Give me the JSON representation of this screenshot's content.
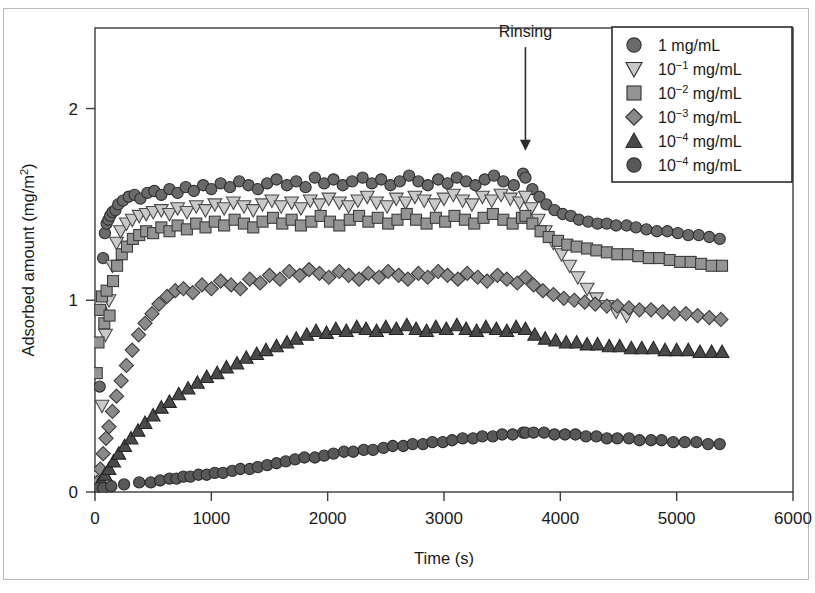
{
  "figure": {
    "background": "#ffffff",
    "frame_color": "#3b3b3b",
    "outer_border_color": "#b9b9b9"
  },
  "annotation": {
    "rinsing_label": "Rinsing",
    "rinsing_x": 3700,
    "arrow_top_y": 2.32,
    "arrow_bottom_y": 1.78
  },
  "legend": {
    "border_color": "#2b2b2b",
    "items": [
      {
        "marker": "circle",
        "label": "1 mg/mL",
        "base": "1",
        "exp": "",
        "unit": " mg/mL",
        "color": "#6a6a6a"
      },
      {
        "marker": "triangle-down",
        "label": "10-1 mg/mL",
        "base": "10",
        "exp": "−1",
        "unit": " mg/mL",
        "color": "#c9c9c9"
      },
      {
        "marker": "square",
        "label": "10-2 mg/mL",
        "base": "10",
        "exp": "−2",
        "unit": " mg/mL",
        "color": "#949494"
      },
      {
        "marker": "diamond",
        "label": "10-3 mg/mL",
        "base": "10",
        "exp": "−3",
        "unit": " mg/mL",
        "color": "#8a8a8a"
      },
      {
        "marker": "triangle-up",
        "label": "10-4 mg/mL",
        "base": "10",
        "exp": "−4",
        "unit": " mg/mL",
        "color": "#4a4a4a"
      },
      {
        "marker": "circle",
        "label": "10-4 mg/mL",
        "base": "10",
        "exp": "−4",
        "unit": " mg/mL",
        "color": "#585858"
      }
    ]
  },
  "chart_data": {
    "type": "scatter",
    "title": "",
    "xlabel": "Time (s)",
    "ylabel": "Adsorbed amount (mg/m2)",
    "ylabel_base": "Adsorbed amount (mg/m",
    "ylabel_sup": "2",
    "ylabel_tail": ")",
    "xlim": [
      0,
      6000
    ],
    "ylim": [
      0,
      2.42
    ],
    "xticks": [
      0,
      1000,
      2000,
      3000,
      4000,
      5000,
      6000
    ],
    "xticklabels": [
      "0",
      "1000",
      "2000",
      "3000",
      "4000",
      "5000",
      "6000"
    ],
    "yticks": [
      0,
      1,
      2
    ],
    "yticklabels": [
      "0",
      "1",
      "2"
    ],
    "grid": false,
    "legend_position": "upper-right",
    "rinsing_time": 3700,
    "series": [
      {
        "name": "1 mg/mL",
        "marker": "circle",
        "color": "#6a6a6a",
        "edge": "#2f2f2f",
        "size": 11,
        "x": [
          20,
          40,
          55,
          70,
          85,
          100,
          115,
          130,
          150,
          175,
          200,
          240,
          290,
          340,
          390,
          450,
          510,
          570,
          640,
          710,
          780,
          850,
          930,
          1000,
          1080,
          1160,
          1240,
          1320,
          1400,
          1480,
          1560,
          1650,
          1730,
          1810,
          1890,
          1970,
          2050,
          2130,
          2210,
          2300,
          2380,
          2460,
          2540,
          2620,
          2700,
          2780,
          2860,
          2950,
          3030,
          3110,
          3190,
          3270,
          3350,
          3430,
          3510,
          3600,
          3680,
          3700,
          3760,
          3820,
          3880,
          3950,
          4020,
          4090,
          4160,
          4240,
          4320,
          4400,
          4480,
          4570,
          4650,
          4740,
          4830,
          4920,
          5010,
          5100,
          5190,
          5280,
          5370
        ],
        "y": [
          0.1,
          0.55,
          0.95,
          1.22,
          1.35,
          1.4,
          1.42,
          1.44,
          1.46,
          1.47,
          1.5,
          1.52,
          1.54,
          1.55,
          1.53,
          1.56,
          1.57,
          1.55,
          1.58,
          1.56,
          1.59,
          1.57,
          1.6,
          1.58,
          1.61,
          1.59,
          1.62,
          1.6,
          1.58,
          1.61,
          1.63,
          1.6,
          1.62,
          1.59,
          1.64,
          1.61,
          1.63,
          1.6,
          1.62,
          1.64,
          1.61,
          1.63,
          1.6,
          1.62,
          1.65,
          1.62,
          1.6,
          1.63,
          1.61,
          1.64,
          1.62,
          1.6,
          1.63,
          1.65,
          1.62,
          1.6,
          1.66,
          1.64,
          1.58,
          1.54,
          1.5,
          1.47,
          1.45,
          1.44,
          1.42,
          1.41,
          1.4,
          1.4,
          1.39,
          1.39,
          1.38,
          1.37,
          1.36,
          1.36,
          1.35,
          1.34,
          1.34,
          1.33,
          1.32
        ]
      },
      {
        "name": "10-1 mg/mL",
        "marker": "triangle-down",
        "color": "#c9c9c9",
        "edge": "#4a4a4a",
        "size": 12,
        "x": [
          30,
          60,
          90,
          120,
          150,
          185,
          220,
          270,
          320,
          380,
          440,
          500,
          570,
          640,
          710,
          790,
          870,
          950,
          1030,
          1110,
          1190,
          1280,
          1360,
          1440,
          1520,
          1600,
          1690,
          1770,
          1850,
          1930,
          2010,
          2100,
          2180,
          2260,
          2340,
          2420,
          2510,
          2590,
          2670,
          2750,
          2830,
          2920,
          3000,
          3080,
          3160,
          3240,
          3330,
          3410,
          3490,
          3570,
          3650,
          3700,
          3750,
          3810,
          3870,
          3940,
          4010,
          4080,
          4150,
          4230,
          4310,
          4400,
          4480,
          4570
        ],
        "y": [
          0.08,
          0.45,
          0.82,
          1.0,
          1.18,
          1.3,
          1.36,
          1.4,
          1.42,
          1.44,
          1.45,
          1.46,
          1.47,
          1.45,
          1.48,
          1.46,
          1.49,
          1.47,
          1.5,
          1.48,
          1.51,
          1.49,
          1.47,
          1.5,
          1.52,
          1.49,
          1.51,
          1.48,
          1.52,
          1.5,
          1.53,
          1.51,
          1.49,
          1.52,
          1.54,
          1.51,
          1.49,
          1.53,
          1.51,
          1.54,
          1.52,
          1.5,
          1.53,
          1.55,
          1.52,
          1.5,
          1.54,
          1.52,
          1.55,
          1.53,
          1.51,
          1.54,
          1.48,
          1.42,
          1.36,
          1.3,
          1.24,
          1.18,
          1.12,
          1.06,
          1.01,
          0.97,
          0.94,
          0.92
        ]
      },
      {
        "name": "10-2 mg/mL",
        "marker": "square",
        "color": "#949494",
        "edge": "#3c3c3c",
        "size": 11,
        "x": [
          15,
          30,
          45,
          60,
          80,
          100,
          125,
          155,
          190,
          230,
          275,
          325,
          380,
          440,
          500,
          570,
          640,
          710,
          790,
          870,
          950,
          1030,
          1110,
          1200,
          1280,
          1360,
          1440,
          1530,
          1610,
          1690,
          1770,
          1860,
          1940,
          2020,
          2100,
          2190,
          2270,
          2350,
          2430,
          2520,
          2600,
          2680,
          2760,
          2850,
          2930,
          3010,
          3090,
          3180,
          3260,
          3340,
          3420,
          3510,
          3590,
          3670,
          3700,
          3760,
          3830,
          3900,
          3980,
          4060,
          4140,
          4230,
          4310,
          4400,
          4490,
          4580,
          4670,
          4760,
          4850,
          4940,
          5030,
          5120,
          5210,
          5300,
          5390
        ],
        "y": [
          0.62,
          0.78,
          0.95,
          1.02,
          0.88,
          1.05,
          0.92,
          1.1,
          1.18,
          1.24,
          1.28,
          1.32,
          1.34,
          1.36,
          1.35,
          1.38,
          1.36,
          1.39,
          1.37,
          1.4,
          1.38,
          1.41,
          1.39,
          1.42,
          1.4,
          1.38,
          1.41,
          1.43,
          1.4,
          1.42,
          1.39,
          1.41,
          1.44,
          1.41,
          1.39,
          1.42,
          1.44,
          1.41,
          1.43,
          1.4,
          1.42,
          1.45,
          1.42,
          1.4,
          1.43,
          1.41,
          1.44,
          1.42,
          1.4,
          1.43,
          1.45,
          1.42,
          1.4,
          1.43,
          1.44,
          1.4,
          1.36,
          1.33,
          1.31,
          1.29,
          1.28,
          1.27,
          1.26,
          1.25,
          1.24,
          1.24,
          1.23,
          1.22,
          1.22,
          1.21,
          1.2,
          1.2,
          1.19,
          1.18,
          1.18
        ]
      },
      {
        "name": "10-3 mg/mL",
        "marker": "diamond",
        "color": "#8a8a8a",
        "edge": "#3c3c3c",
        "size": 12,
        "x": [
          20,
          45,
          70,
          95,
          120,
          150,
          185,
          225,
          270,
          320,
          375,
          430,
          490,
          550,
          620,
          690,
          760,
          840,
          920,
          1000,
          1080,
          1170,
          1250,
          1330,
          1420,
          1500,
          1590,
          1670,
          1760,
          1840,
          1930,
          2010,
          2100,
          2180,
          2270,
          2350,
          2440,
          2520,
          2610,
          2690,
          2780,
          2860,
          2950,
          3030,
          3120,
          3200,
          3290,
          3370,
          3460,
          3540,
          3630,
          3700,
          3770,
          3850,
          3940,
          4030,
          4120,
          4210,
          4300,
          4400,
          4490,
          4590,
          4680,
          4780,
          4880,
          4980,
          5080,
          5180,
          5280,
          5380
        ],
        "y": [
          0.05,
          0.12,
          0.2,
          0.28,
          0.34,
          0.42,
          0.5,
          0.58,
          0.66,
          0.74,
          0.82,
          0.88,
          0.93,
          0.98,
          1.02,
          1.05,
          1.06,
          1.04,
          1.08,
          1.06,
          1.1,
          1.08,
          1.06,
          1.11,
          1.09,
          1.13,
          1.11,
          1.15,
          1.13,
          1.16,
          1.14,
          1.12,
          1.15,
          1.13,
          1.11,
          1.14,
          1.12,
          1.15,
          1.13,
          1.11,
          1.14,
          1.12,
          1.15,
          1.13,
          1.11,
          1.14,
          1.12,
          1.1,
          1.13,
          1.11,
          1.09,
          1.12,
          1.08,
          1.05,
          1.03,
          1.01,
          1.0,
          0.99,
          0.98,
          0.97,
          0.97,
          0.96,
          0.95,
          0.95,
          0.94,
          0.93,
          0.93,
          0.92,
          0.91,
          0.9
        ]
      },
      {
        "name": "10-4 mg/mL (triangle)",
        "marker": "triangle-up",
        "color": "#4a4a4a",
        "edge": "#262626",
        "size": 12,
        "x": [
          25,
          55,
          85,
          120,
          160,
          205,
          255,
          310,
          370,
          430,
          500,
          570,
          640,
          720,
          800,
          880,
          960,
          1050,
          1130,
          1220,
          1300,
          1390,
          1470,
          1560,
          1650,
          1730,
          1820,
          1900,
          1990,
          2070,
          2160,
          2250,
          2330,
          2420,
          2500,
          2590,
          2680,
          2760,
          2850,
          2930,
          3020,
          3110,
          3190,
          3280,
          3360,
          3450,
          3540,
          3620,
          3700,
          3780,
          3870,
          3960,
          4050,
          4140,
          4230,
          4320,
          4420,
          4510,
          4610,
          4700,
          4800,
          4900,
          5000,
          5100,
          5200,
          5300,
          5390
        ],
        "y": [
          0.03,
          0.06,
          0.09,
          0.12,
          0.16,
          0.2,
          0.24,
          0.28,
          0.32,
          0.36,
          0.4,
          0.44,
          0.47,
          0.51,
          0.54,
          0.57,
          0.6,
          0.62,
          0.65,
          0.67,
          0.7,
          0.72,
          0.74,
          0.76,
          0.78,
          0.8,
          0.82,
          0.84,
          0.83,
          0.85,
          0.84,
          0.86,
          0.85,
          0.84,
          0.86,
          0.85,
          0.87,
          0.85,
          0.84,
          0.86,
          0.85,
          0.87,
          0.85,
          0.84,
          0.86,
          0.85,
          0.84,
          0.86,
          0.85,
          0.82,
          0.8,
          0.79,
          0.78,
          0.78,
          0.77,
          0.77,
          0.76,
          0.76,
          0.75,
          0.75,
          0.75,
          0.74,
          0.74,
          0.74,
          0.73,
          0.73,
          0.73
        ]
      },
      {
        "name": "10-4 mg/mL (circle)",
        "marker": "circle",
        "color": "#585858",
        "edge": "#2b2b2b",
        "size": 11,
        "x": [
          30,
          70,
          140,
          250,
          380,
          480,
          560,
          640,
          700,
          760,
          820,
          890,
          960,
          1030,
          1100,
          1180,
          1250,
          1330,
          1400,
          1480,
          1560,
          1640,
          1720,
          1800,
          1890,
          1970,
          2050,
          2140,
          2220,
          2310,
          2390,
          2480,
          2560,
          2650,
          2730,
          2820,
          2900,
          2990,
          3070,
          3160,
          3250,
          3330,
          3420,
          3500,
          3590,
          3680,
          3700,
          3770,
          3860,
          3950,
          4040,
          4130,
          4220,
          4310,
          4400,
          4490,
          4590,
          4680,
          4780,
          4870,
          4970,
          5070,
          5170,
          5270,
          5370
        ],
        "y": [
          0.02,
          0.02,
          0.03,
          0.04,
          0.05,
          0.05,
          0.06,
          0.07,
          0.07,
          0.08,
          0.08,
          0.09,
          0.09,
          0.1,
          0.1,
          0.11,
          0.12,
          0.12,
          0.13,
          0.14,
          0.15,
          0.16,
          0.17,
          0.18,
          0.18,
          0.19,
          0.2,
          0.21,
          0.21,
          0.22,
          0.22,
          0.23,
          0.24,
          0.24,
          0.25,
          0.25,
          0.26,
          0.26,
          0.27,
          0.28,
          0.28,
          0.29,
          0.29,
          0.3,
          0.3,
          0.31,
          0.31,
          0.31,
          0.31,
          0.3,
          0.3,
          0.3,
          0.29,
          0.29,
          0.28,
          0.28,
          0.28,
          0.27,
          0.27,
          0.27,
          0.26,
          0.26,
          0.26,
          0.25,
          0.25
        ]
      }
    ]
  }
}
